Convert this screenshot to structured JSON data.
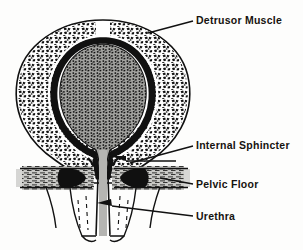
{
  "figure": {
    "background_color": "#fdfdfc",
    "ink_color": "#16130f",
    "lumen_color": "#9d9d9a",
    "wall_color": "#101010"
  },
  "annotations": [
    {
      "id": "detrusor",
      "label": "Detrusor Muscle",
      "leader": "line",
      "target": "bladder-wall-upper-right"
    },
    {
      "id": "internal_sphincter",
      "label": "Internal Sphincter",
      "leader": "arrow",
      "target": "bladder-neck"
    },
    {
      "id": "pelvic_floor",
      "label": "Pelvic Floor",
      "leader": "line",
      "target": "pelvic-floor-band-right"
    },
    {
      "id": "urethra",
      "label": "Urethra",
      "leader": "arrow",
      "target": "urethral-channel"
    }
  ],
  "structures": [
    {
      "id": "detrusor-muscle",
      "name": "Detrusor Muscle",
      "description": "Mottled muscular bladder wall"
    },
    {
      "id": "bladder-lumen",
      "name": "Bladder Lumen",
      "description": "Stippled interior cavity"
    },
    {
      "id": "internal-sphincter",
      "name": "Internal Sphincter",
      "description": "Bladder neck funnel"
    },
    {
      "id": "pelvic-floor",
      "name": "Pelvic Floor",
      "description": "Horizontal muscle band"
    },
    {
      "id": "urethra",
      "name": "Urethra",
      "description": "Vertical outflow channel"
    }
  ]
}
